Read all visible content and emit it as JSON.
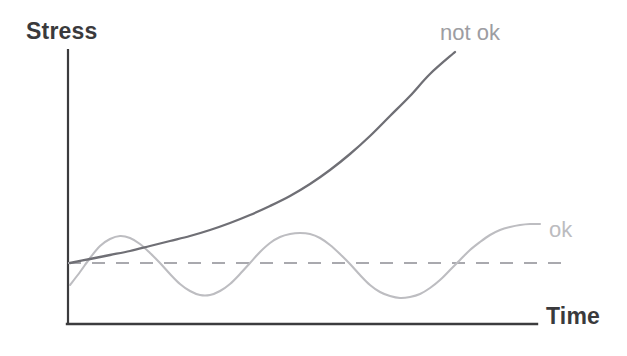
{
  "figure": {
    "width": 627,
    "height": 356,
    "background": "#ffffff"
  },
  "axes": {
    "y_title": "Stress",
    "x_title": "Time",
    "axis_color": "#3c3c3e",
    "origin_px": [
      68,
      324
    ],
    "y_top_px": 50,
    "x_right_px": 537
  },
  "labels": {
    "not_ok": "not ok",
    "ok": "ok"
  },
  "colors": {
    "exponential_curve": "#6f6f75",
    "oscillating_curve": "#bdbdc1",
    "threshold_dashed": "#a9a9ae",
    "axis": "#3c3c3e",
    "title_text": "#3a3a3c",
    "not_ok_text": "#9d9da2",
    "ok_text": "#bcbcc0"
  },
  "chart_data": {
    "type": "line",
    "title": "",
    "xlabel": "Time",
    "ylabel": "Stress",
    "grid": false,
    "legend": "inline-end-of-curve",
    "axis_ticks": {
      "x": [],
      "y": []
    },
    "xlim": [
      0,
      100
    ],
    "ylim": [
      0,
      100
    ],
    "annotations": [
      {
        "text": "not ok",
        "x_px": 440,
        "y_px": 22,
        "target_series": "not ok"
      },
      {
        "text": "ok",
        "x_px": 549,
        "y_px": 219,
        "target_series": "ok"
      }
    ],
    "reference_lines": [
      {
        "name": "threshold",
        "orientation": "horizontal",
        "y_px": 263,
        "x_start_px": 68,
        "x_end_px": 566,
        "style": "dashed",
        "color": "#a9a9ae"
      }
    ],
    "series": [
      {
        "name": "not ok",
        "description": "exponentially growing stress that diverges upward past the threshold",
        "color": "#6f6f75",
        "style": "solid",
        "points_px": [
          [
            70,
            263
          ],
          [
            90,
            259
          ],
          [
            110,
            255
          ],
          [
            130,
            251
          ],
          [
            150,
            246
          ],
          [
            170,
            241
          ],
          [
            190,
            236
          ],
          [
            210,
            230
          ],
          [
            230,
            223
          ],
          [
            250,
            215
          ],
          [
            270,
            206
          ],
          [
            290,
            196
          ],
          [
            310,
            184
          ],
          [
            330,
            170
          ],
          [
            350,
            154
          ],
          [
            370,
            136
          ],
          [
            390,
            116
          ],
          [
            410,
            96
          ],
          [
            430,
            74
          ],
          [
            455,
            52
          ]
        ]
      },
      {
        "name": "ok",
        "description": "bounded oscillation of stress about the threshold level",
        "color": "#bdbdc1",
        "style": "solid",
        "points_px": [
          [
            70,
            285
          ],
          [
            80,
            272
          ],
          [
            90,
            258
          ],
          [
            100,
            246
          ],
          [
            110,
            239
          ],
          [
            120,
            236
          ],
          [
            130,
            238
          ],
          [
            140,
            244
          ],
          [
            150,
            253
          ],
          [
            160,
            263
          ],
          [
            170,
            274
          ],
          [
            180,
            284
          ],
          [
            190,
            291
          ],
          [
            200,
            295
          ],
          [
            210,
            295
          ],
          [
            220,
            291
          ],
          [
            230,
            284
          ],
          [
            240,
            274
          ],
          [
            250,
            263
          ],
          [
            260,
            252
          ],
          [
            270,
            243
          ],
          [
            280,
            237
          ],
          [
            290,
            234
          ],
          [
            300,
            233
          ],
          [
            310,
            234
          ],
          [
            320,
            238
          ],
          [
            330,
            245
          ],
          [
            340,
            254
          ],
          [
            350,
            264
          ],
          [
            360,
            275
          ],
          [
            370,
            285
          ],
          [
            380,
            292
          ],
          [
            390,
            296
          ],
          [
            400,
            298
          ],
          [
            410,
            297
          ],
          [
            420,
            294
          ],
          [
            430,
            288
          ],
          [
            440,
            280
          ],
          [
            450,
            270
          ],
          [
            460,
            260
          ],
          [
            470,
            250
          ],
          [
            480,
            242
          ],
          [
            490,
            235
          ],
          [
            500,
            230
          ],
          [
            510,
            227
          ],
          [
            520,
            225
          ],
          [
            530,
            224
          ],
          [
            540,
            224
          ]
        ]
      }
    ]
  }
}
